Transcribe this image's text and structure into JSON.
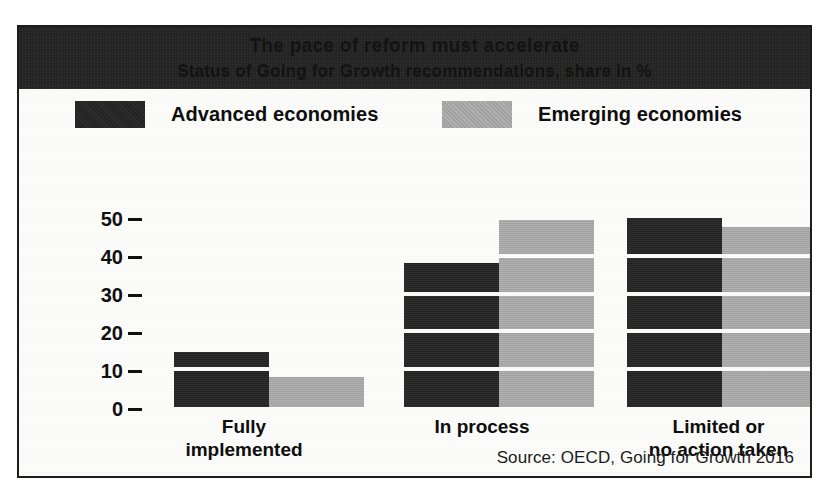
{
  "figure": {
    "title": "The pace of reform must accelerate",
    "subtitle": "Status of Going for Growth recommendations, share in %",
    "source": "Source: OECD, Going for Growth 2016"
  },
  "legend": {
    "position": "top",
    "entries": [
      {
        "label": "Advanced economies",
        "swatch": "dark",
        "color": "#262626"
      },
      {
        "label": "Emerging economies",
        "swatch": "gray",
        "color": "#a9a9a9"
      }
    ]
  },
  "axis": {
    "y_ticks": [
      "50",
      "40",
      "30",
      "20",
      "10",
      "0"
    ]
  },
  "chart_data": {
    "type": "bar",
    "title": "The pace of reform must accelerate",
    "subtitle": "Status of Going for Growth recommendations, share in %",
    "categories": [
      "Fully\nimplemented",
      "In process",
      "Limited or\nno action taken"
    ],
    "series": [
      {
        "name": "Advanced economies",
        "color": "#262626",
        "values": [
          14.5,
          38,
          50
        ]
      },
      {
        "name": "Emerging economies",
        "color": "#a9a9a9",
        "values": [
          8,
          49.5,
          47.5
        ]
      }
    ],
    "xlabel": "",
    "ylabel": "share in %",
    "ylim": [
      0,
      52
    ],
    "yticks": [
      0,
      10,
      20,
      30,
      40,
      50
    ],
    "grid": "horizontal-white-bands-inside-bars",
    "legend_position": "top",
    "source": "Source: OECD, Going for Growth 2016"
  }
}
